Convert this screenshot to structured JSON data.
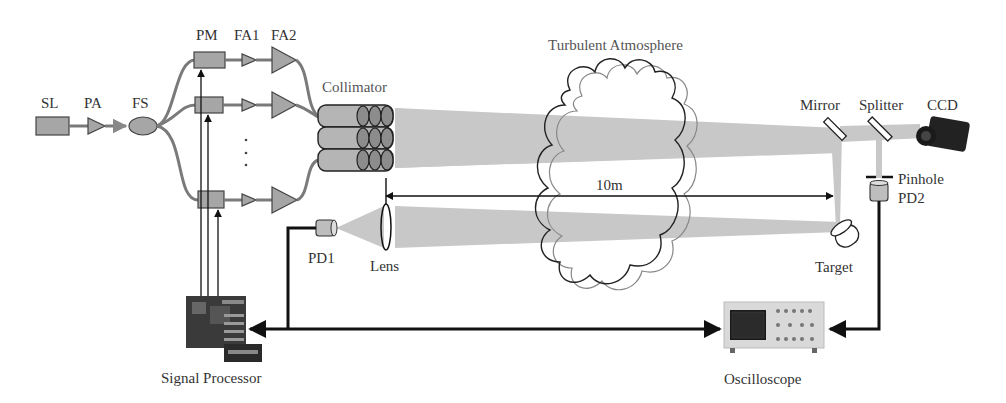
{
  "diagram": {
    "labels": {
      "sl": "SL",
      "pa": "PA",
      "fs": "FS",
      "pm": "PM",
      "fa1": "FA1",
      "fa2": "FA2",
      "collimator": "Collimator",
      "turbulent_atmosphere": "Turbulent Atmosphere",
      "distance": "10m",
      "mirror": "Mirror",
      "splitter": "Splitter",
      "ccd": "CCD",
      "pinhole": "Pinhole",
      "pd2": "PD2",
      "target": "Target",
      "pd1": "PD1",
      "lens": "Lens",
      "signal_processor": "Signal Processor",
      "oscilloscope": "Oscilloscope",
      "ellipsis": "⋮"
    },
    "colors": {
      "component_fill": "#a6a6a6",
      "fiber": "#7a7a7a",
      "beam": "#c8c8c8",
      "line": "#111111",
      "text": "#333333"
    }
  }
}
